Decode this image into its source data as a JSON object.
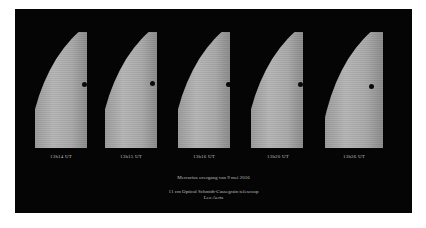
{
  "composite": {
    "background_color": "#050505",
    "panels": [
      {
        "time": "13h14 UT",
        "dot_x": 51,
        "dot_y": 54
      },
      {
        "time": "13h15 UT",
        "dot_x": 49,
        "dot_y": 53
      },
      {
        "time": "13h16 UT",
        "dot_x": 52,
        "dot_y": 54
      },
      {
        "time": "13h20 UT",
        "dot_x": 45,
        "dot_y": 54
      },
      {
        "time": "13h26 UT",
        "dot_x": 45,
        "dot_y": 55
      }
    ],
    "title": "Mercurius overgang van 9 mei 2016",
    "credits_line": "11 cm Optical Schmidt-Cassegrain telescoop",
    "author": "Leo Aerts"
  }
}
